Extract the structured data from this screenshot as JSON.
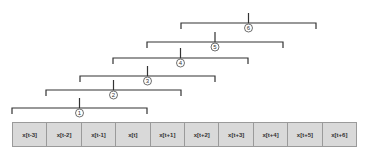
{
  "cells": [
    "x[t-3]",
    "x[t-2]",
    "x[t-1]",
    "x[t]",
    "x[t+1]",
    "x[t+2]",
    "x[t+3]",
    "x[t+4]",
    "x[t+5]",
    "x[t+6]"
  ],
  "brackets": [
    {
      "label": "1",
      "x1": 12,
      "x2": 147,
      "y": 108
    },
    {
      "label": "2",
      "x1": 46,
      "x2": 181,
      "y": 90
    },
    {
      "label": "3",
      "x1": 80,
      "x2": 215,
      "y": 76
    },
    {
      "label": "4",
      "x1": 113,
      "x2": 248,
      "y": 58
    },
    {
      "label": "5",
      "x1": 147,
      "x2": 283,
      "y": 42
    },
    {
      "label": "6",
      "x1": 181,
      "x2": 316,
      "y": 23
    }
  ],
  "colors": {
    "cell_fill": "#d9d9d9",
    "cell_border": "#9a9a9a",
    "line": "#333333"
  }
}
